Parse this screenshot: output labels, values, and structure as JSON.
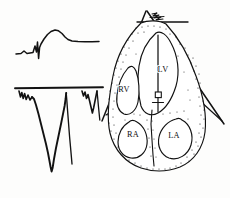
{
  "figure": {
    "background_color": "#fdfdfc",
    "ink_color": "#121212"
  },
  "ecg_panel": {
    "name": "ecg-tracings",
    "traces": [
      {
        "id": "upper-trace",
        "label": "upper ECG complex",
        "description": "small initial deflection, sharp R wave, deep narrow S wave, broad elevated ST-T segment returning to baseline",
        "baseline_y": 52,
        "polarity": "predominantly positive with ST elevation"
      },
      {
        "id": "lower-trace",
        "label": "lower ECG complex",
        "description": "horizontal baseline with notched initial deflections and deep wide QS complex, plus a smaller secondary QS complex at right",
        "baseline_y": 88,
        "polarity": "predominantly negative (QS pattern)"
      }
    ],
    "baseline_rule": {
      "name": "baseline-rule",
      "x1": 15,
      "x2": 103,
      "y": 88
    }
  },
  "heart_panel": {
    "name": "heart-cross-section",
    "orientation": "apex superior, four-chamber view",
    "myocardium_texture": "stippled",
    "chambers": [
      {
        "id": "rv",
        "label": "RV",
        "full_name": "right ventricle",
        "x": 124,
        "y": 90
      },
      {
        "id": "lv",
        "label": "LV",
        "full_name": "left ventricle",
        "x": 163,
        "y": 70
      },
      {
        "id": "ra",
        "label": "RA",
        "full_name": "right atrium",
        "x": 133,
        "y": 135
      },
      {
        "id": "la",
        "label": "LA",
        "full_name": "left atrium",
        "x": 172,
        "y": 136
      }
    ],
    "catheter": {
      "name": "intracardiac-electrode-catheter",
      "description": "line entering the left ventricular cavity from the apex with a rectangular electrode marker and cross-bar near its tip",
      "tip_x": 158,
      "tip_y": 35,
      "electrode_x": 159,
      "electrode_y": 96
    },
    "apex_marking": {
      "name": "apex-squiggle-marking",
      "description": "small zigzag shading mark at the cardiac apex between the converging outer lines"
    },
    "outer_lines": {
      "name": "thoracic-outline-lines",
      "description": "straight converging lines forming a wedge around the heart, with a short transverse line at the apex"
    }
  }
}
